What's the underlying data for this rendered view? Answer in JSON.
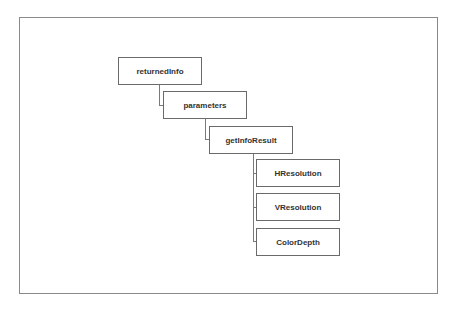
{
  "diagram": {
    "type": "tree",
    "nodes": [
      {
        "id": "returnedInfo",
        "label": "returnedInfo",
        "children": [
          "parameters"
        ]
      },
      {
        "id": "parameters",
        "label": "parameters",
        "children": [
          "getInfoResult"
        ]
      },
      {
        "id": "getInfoResult",
        "label": "getInfoResult",
        "children": [
          "HResolution",
          "VResolution",
          "ColorDepth"
        ]
      },
      {
        "id": "HResolution",
        "label": "HResolution",
        "children": []
      },
      {
        "id": "VResolution",
        "label": "VResolution",
        "children": []
      },
      {
        "id": "ColorDepth",
        "label": "ColorDepth",
        "children": []
      }
    ]
  },
  "colors": {
    "border": "#6a6a6a",
    "line": "#7a7a7a",
    "text": "#333333"
  }
}
